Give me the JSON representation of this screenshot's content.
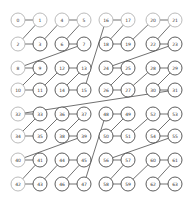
{
  "diagram": {
    "type": "z-order-curve",
    "node_radius": 7,
    "columns_x": [
      18,
      40,
      62,
      84,
      106,
      128,
      153,
      175
    ],
    "rows_y": [
      20,
      44,
      68,
      90,
      114,
      136,
      160,
      184
    ],
    "light_nodes": [
      0,
      1,
      2,
      4,
      5,
      8,
      10,
      16,
      17,
      20,
      21,
      32,
      34,
      40,
      42
    ],
    "nodes": [
      {
        "id": 0,
        "label": "0",
        "col": 0,
        "row": 0
      },
      {
        "id": 1,
        "label": "1",
        "col": 1,
        "row": 0
      },
      {
        "id": 2,
        "label": "2",
        "col": 0,
        "row": 1
      },
      {
        "id": 3,
        "label": "3",
        "col": 1,
        "row": 1
      },
      {
        "id": 4,
        "label": "4",
        "col": 2,
        "row": 0
      },
      {
        "id": 5,
        "label": "5",
        "col": 3,
        "row": 0
      },
      {
        "id": 6,
        "label": "6",
        "col": 2,
        "row": 1
      },
      {
        "id": 7,
        "label": "7",
        "col": 3,
        "row": 1
      },
      {
        "id": 8,
        "label": "8",
        "col": 0,
        "row": 2
      },
      {
        "id": 9,
        "label": "9",
        "col": 1,
        "row": 2
      },
      {
        "id": 10,
        "label": "10",
        "col": 0,
        "row": 3
      },
      {
        "id": 11,
        "label": "11",
        "col": 1,
        "row": 3
      },
      {
        "id": 12,
        "label": "12",
        "col": 2,
        "row": 2
      },
      {
        "id": 13,
        "label": "13",
        "col": 3,
        "row": 2
      },
      {
        "id": 14,
        "label": "14",
        "col": 2,
        "row": 3
      },
      {
        "id": 15,
        "label": "15",
        "col": 3,
        "row": 3
      },
      {
        "id": 16,
        "label": "16",
        "col": 4,
        "row": 0
      },
      {
        "id": 17,
        "label": "17",
        "col": 5,
        "row": 0
      },
      {
        "id": 18,
        "label": "18",
        "col": 4,
        "row": 1
      },
      {
        "id": 19,
        "label": "19",
        "col": 5,
        "row": 1
      },
      {
        "id": 20,
        "label": "20",
        "col": 6,
        "row": 0
      },
      {
        "id": 21,
        "label": "21",
        "col": 7,
        "row": 0
      },
      {
        "id": 22,
        "label": "22",
        "col": 6,
        "row": 1
      },
      {
        "id": 23,
        "label": "23",
        "col": 7,
        "row": 1
      },
      {
        "id": 24,
        "label": "24",
        "col": 4,
        "row": 2
      },
      {
        "id": 25,
        "label": "25",
        "col": 5,
        "row": 2
      },
      {
        "id": 26,
        "label": "26",
        "col": 4,
        "row": 3
      },
      {
        "id": 27,
        "label": "27",
        "col": 5,
        "row": 3
      },
      {
        "id": 28,
        "label": "28",
        "col": 6,
        "row": 2
      },
      {
        "id": 29,
        "label": "29",
        "col": 7,
        "row": 2
      },
      {
        "id": 30,
        "label": "30",
        "col": 6,
        "row": 3
      },
      {
        "id": 31,
        "label": "31",
        "col": 7,
        "row": 3
      },
      {
        "id": 32,
        "label": "32",
        "col": 0,
        "row": 4
      },
      {
        "id": 33,
        "label": "33",
        "col": 1,
        "row": 4
      },
      {
        "id": 34,
        "label": "34",
        "col": 0,
        "row": 5
      },
      {
        "id": 35,
        "label": "35",
        "col": 1,
        "row": 5
      },
      {
        "id": 36,
        "label": "36",
        "col": 2,
        "row": 4
      },
      {
        "id": 37,
        "label": "37",
        "col": 3,
        "row": 4
      },
      {
        "id": 38,
        "label": "38",
        "col": 2,
        "row": 5
      },
      {
        "id": 39,
        "label": "39",
        "col": 3,
        "row": 5
      },
      {
        "id": 40,
        "label": "40",
        "col": 0,
        "row": 6
      },
      {
        "id": 41,
        "label": "41",
        "col": 1,
        "row": 6
      },
      {
        "id": 42,
        "label": "42",
        "col": 0,
        "row": 7
      },
      {
        "id": 43,
        "label": "43",
        "col": 1,
        "row": 7
      },
      {
        "id": 44,
        "label": "44",
        "col": 2,
        "row": 6
      },
      {
        "id": 45,
        "label": "45",
        "col": 3,
        "row": 6
      },
      {
        "id": 46,
        "label": "46",
        "col": 2,
        "row": 7
      },
      {
        "id": 47,
        "label": "47",
        "col": 3,
        "row": 7
      },
      {
        "id": 48,
        "label": "48",
        "col": 4,
        "row": 4
      },
      {
        "id": 49,
        "label": "49",
        "col": 5,
        "row": 4
      },
      {
        "id": 50,
        "label": "50",
        "col": 4,
        "row": 5
      },
      {
        "id": 51,
        "label": "51",
        "col": 5,
        "row": 5
      },
      {
        "id": 52,
        "label": "52",
        "col": 6,
        "row": 4
      },
      {
        "id": 53,
        "label": "53",
        "col": 7,
        "row": 4
      },
      {
        "id": 54,
        "label": "54",
        "col": 6,
        "row": 5
      },
      {
        "id": 55,
        "label": "55",
        "col": 7,
        "row": 5
      },
      {
        "id": 56,
        "label": "56",
        "col": 4,
        "row": 6
      },
      {
        "id": 57,
        "label": "57",
        "col": 5,
        "row": 6
      },
      {
        "id": 58,
        "label": "58",
        "col": 4,
        "row": 7
      },
      {
        "id": 59,
        "label": "59",
        "col": 5,
        "row": 7
      },
      {
        "id": 60,
        "label": "60",
        "col": 6,
        "row": 6
      },
      {
        "id": 61,
        "label": "61",
        "col": 7,
        "row": 6
      },
      {
        "id": 62,
        "label": "62",
        "col": 6,
        "row": 7
      },
      {
        "id": 63,
        "label": "63",
        "col": 7,
        "row": 7
      }
    ]
  }
}
